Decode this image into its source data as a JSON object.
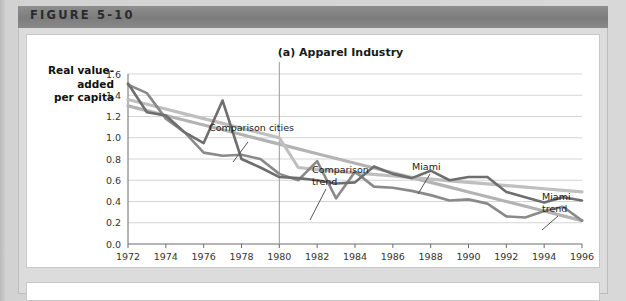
{
  "figure": {
    "header_label": "FIGURE 5-10"
  },
  "chart_data": {
    "type": "line",
    "title": "(a) Apparel Industry",
    "ylabel": "Real value-\nadded\nper capita",
    "ylabel_lines": [
      "Real value-",
      "added",
      "per capita"
    ],
    "xlabel": "",
    "ylim": [
      0.0,
      1.6
    ],
    "xlim": [
      1972,
      1996
    ],
    "ytick_step": 0.2,
    "xtick_step": 2,
    "yticks": [
      "0.0",
      "0.2",
      "0.4",
      "0.6",
      "0.8",
      "1.0",
      "1.2",
      "1.4",
      "1.6"
    ],
    "xticks": [
      "1972",
      "1974",
      "1976",
      "1978",
      "1980",
      "1982",
      "1984",
      "1986",
      "1988",
      "1990",
      "1992",
      "1994",
      "1996"
    ],
    "grid": true,
    "legend": "annotations",
    "reference_line": {
      "x": 1980,
      "label": ""
    },
    "x": [
      1972,
      1973,
      1974,
      1975,
      1976,
      1977,
      1978,
      1979,
      1980,
      1981,
      1982,
      1983,
      1984,
      1985,
      1986,
      1987,
      1988,
      1989,
      1990,
      1991,
      1992,
      1993,
      1994,
      1995,
      1996
    ],
    "series": [
      {
        "name": "Comparison cities",
        "color": "#8a8a8a",
        "width": 2.6,
        "values": [
          1.5,
          1.42,
          1.18,
          1.05,
          0.86,
          0.83,
          0.84,
          0.8,
          0.66,
          0.6,
          0.78,
          0.43,
          0.68,
          0.54,
          0.53,
          0.5,
          0.46,
          0.41,
          0.42,
          0.38,
          0.26,
          0.25,
          0.31,
          0.35,
          0.22
        ]
      },
      {
        "name": "Miami",
        "color": "#6e6e6e",
        "width": 2.6,
        "values": [
          1.51,
          1.24,
          1.21,
          1.05,
          0.95,
          1.35,
          0.8,
          0.72,
          0.63,
          0.62,
          0.6,
          0.57,
          0.58,
          0.73,
          0.66,
          0.62,
          0.69,
          0.6,
          0.63,
          0.63,
          0.49,
          0.44,
          0.39,
          0.44,
          0.41
        ]
      },
      {
        "name": "Comparison trend",
        "color": "#b3b3b3",
        "width": 3.2,
        "values": [
          1.3,
          1.255,
          1.21,
          1.165,
          1.12,
          1.075,
          1.03,
          0.985,
          0.94,
          0.895,
          0.85,
          0.805,
          0.76,
          0.715,
          0.67,
          0.625,
          0.58,
          0.535,
          0.49,
          0.445,
          0.4,
          0.355,
          0.31,
          0.265,
          0.22
        ]
      },
      {
        "name": "Miami trend",
        "color": "#bfbfbf",
        "width": 3.2,
        "values": [
          1.36,
          1.315,
          1.27,
          1.225,
          1.18,
          1.135,
          1.09,
          1.045,
          1.0,
          0.72,
          0.7,
          0.685,
          0.67,
          0.655,
          0.64,
          0.625,
          0.61,
          0.595,
          0.58,
          0.565,
          0.55,
          0.535,
          0.52,
          0.505,
          0.49
        ]
      }
    ],
    "annotations": [
      {
        "text": "Comparison cities",
        "x": 183,
        "y": 97
      },
      {
        "text": "Comparison",
        "x": 286,
        "y": 139
      },
      {
        "text": "trend",
        "x": 286,
        "y": 151
      },
      {
        "text": "Miami",
        "x": 386,
        "y": 136
      },
      {
        "text": "Miami",
        "x": 516,
        "y": 166
      },
      {
        "text": "trend",
        "x": 516,
        "y": 178
      }
    ]
  }
}
